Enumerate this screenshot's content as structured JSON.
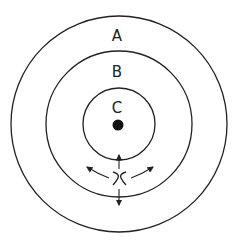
{
  "diagram": {
    "title": "",
    "rings": [
      {
        "label": "A",
        "cx": 119,
        "cy": 124,
        "r": 108,
        "label_x": 117,
        "label_y": 41
      },
      {
        "label": "B",
        "cx": 119,
        "cy": 124,
        "r": 73,
        "label_x": 117,
        "label_y": 77
      },
      {
        "label": "C",
        "cx": 119,
        "cy": 124,
        "r": 36,
        "label_x": 117,
        "label_y": 111
      }
    ],
    "center_dot": {
      "cx": 118,
      "cy": 125,
      "r": 5
    },
    "particle": {
      "symbol": "x",
      "x": 120,
      "y": 179
    },
    "arrows": [
      "up",
      "down",
      "left",
      "right"
    ],
    "colors": {
      "stroke": "#222222",
      "background": "#ffffff"
    }
  }
}
